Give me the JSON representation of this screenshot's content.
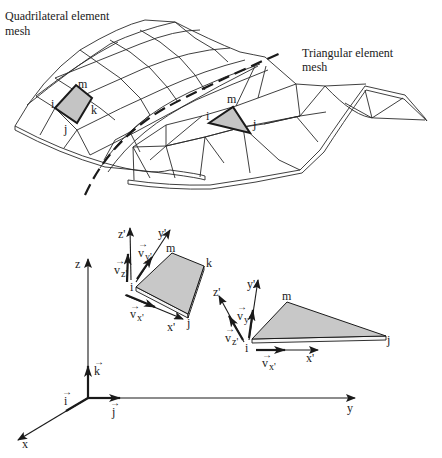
{
  "figure": {
    "type": "finite-element-mesh-diagram",
    "colors": {
      "line": "#1a1a1a",
      "element_fill": "#c4c4c4",
      "background": "#ffffff"
    }
  },
  "mesh_panel": {
    "quad_mesh_label": {
      "line1": "Quadrilateral element",
      "line2": "mesh"
    },
    "tri_mesh_label": {
      "line1": "Triangular element",
      "line2": "mesh"
    },
    "quad_element_nodes": {
      "i": "i",
      "j": "j",
      "k": "k",
      "m": "m"
    },
    "tri_element_nodes": {
      "i": "i",
      "j": "j",
      "m": "m"
    }
  },
  "coordinate_panel": {
    "global_axes": {
      "x": "x",
      "y": "y",
      "z": "z"
    },
    "unit_vectors": {
      "i": "i",
      "j": "j",
      "k": "k"
    },
    "vector_arrow": "→",
    "quad_local": {
      "axes": {
        "x": "x'",
        "y": "y'",
        "z": "z'"
      },
      "vectors": {
        "vx": "v",
        "vx_sub": "x'",
        "vy": "v",
        "vy_sub": "y'",
        "vz": "v",
        "vz_sub": "z'"
      },
      "nodes": {
        "i": "i",
        "j": "j",
        "k": "k",
        "m": "m"
      }
    },
    "tri_local": {
      "axes": {
        "x": "x'",
        "y": "y'",
        "z": "z'"
      },
      "vectors": {
        "vx": "v",
        "vx_sub": "x'",
        "vy": "v",
        "vy_sub": "y'",
        "vz": "v",
        "vz_sub": "z'"
      },
      "nodes": {
        "i": "i",
        "j": "j",
        "m": "m"
      }
    }
  }
}
